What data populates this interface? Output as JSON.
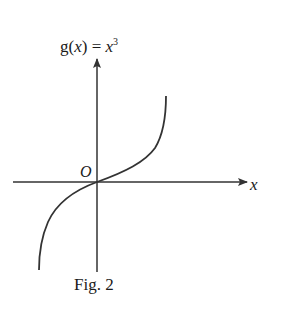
{
  "figure": {
    "function_name": "g",
    "function_arg": "x",
    "function_rhs_base": "x",
    "function_rhs_exponent": "3",
    "origin_label": "O",
    "x_axis_label": "x",
    "caption": "Fig. 2"
  },
  "geometry": {
    "origin": [
      97,
      182
    ],
    "x_axis": {
      "from": [
        13,
        182
      ],
      "to": [
        248,
        182
      ]
    },
    "y_axis": {
      "from": [
        97,
        272
      ],
      "to": [
        97,
        58
      ]
    },
    "curve_upper_end": [
      166,
      96
    ],
    "curve_lower_end": [
      39,
      270
    ]
  },
  "colors": {
    "stroke": "#333333",
    "text": "#1a1a1a",
    "background": "#ffffff"
  }
}
